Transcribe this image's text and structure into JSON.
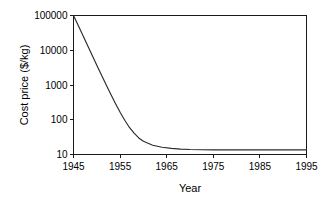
{
  "chart_data": {
    "type": "line",
    "title": "",
    "xlabel": "Year",
    "ylabel": "Cost price ($/kg)",
    "xlim": [
      1945,
      1995
    ],
    "ylim": [
      10,
      100000
    ],
    "yscale": "log",
    "xscale": "linear",
    "grid": false,
    "legend": null,
    "legend_position": "none",
    "xticks": [
      1945,
      1955,
      1965,
      1975,
      1985,
      1995
    ],
    "xtick_labels": [
      "1945",
      "1955",
      "1965",
      "1975",
      "1985",
      "1995"
    ],
    "yticks": [
      10,
      100,
      1000,
      10000,
      100000
    ],
    "ytick_labels": [
      "10",
      "100",
      "1000",
      "10000",
      "100000"
    ],
    "series": [
      {
        "name": "Cost price",
        "color": "#2b2b2b",
        "x": [
          1945,
          1946,
          1947,
          1948,
          1949,
          1950,
          1951,
          1952,
          1953,
          1954,
          1955,
          1956,
          1957,
          1958,
          1959,
          1960,
          1962,
          1964,
          1966,
          1968,
          1970,
          1975,
          1980,
          1985,
          1990,
          1995
        ],
        "y": [
          100000,
          52000,
          27000,
          14000,
          7200,
          3700,
          1950,
          1020,
          540,
          295,
          165,
          97,
          60,
          41,
          30,
          24,
          18.5,
          16.2,
          15.0,
          14.3,
          13.9,
          13.6,
          13.6,
          13.6,
          13.6,
          13.6
        ]
      }
    ],
    "annotations": []
  },
  "axis": {
    "y_title": "Cost price ($/kg)",
    "x_title": "Year"
  }
}
